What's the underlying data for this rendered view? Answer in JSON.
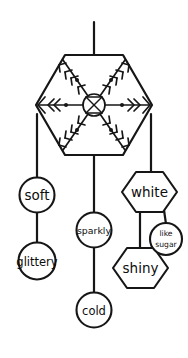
{
  "diagram": {
    "stroke_color": "#161616",
    "background_color": "#ffffff",
    "root": {
      "name": "snowflake",
      "icon": "snowflake-icon",
      "shape": "hexagon",
      "stem": "vertical line above hexagon"
    },
    "branches": [
      {
        "id": "left",
        "nodes": [
          {
            "label": "soft",
            "shape": "circle"
          },
          {
            "label": "glittery",
            "shape": "circle"
          }
        ]
      },
      {
        "id": "middle",
        "nodes": [
          {
            "label": "sparkly",
            "shape": "circle"
          },
          {
            "label": "cold",
            "shape": "circle"
          }
        ]
      },
      {
        "id": "right",
        "nodes": [
          {
            "label": "white",
            "shape": "hexagon"
          },
          {
            "label": "shiny",
            "shape": "hexagon"
          },
          {
            "label_line1": "like",
            "label_line2": "sugar",
            "shape": "circle"
          }
        ]
      }
    ]
  }
}
